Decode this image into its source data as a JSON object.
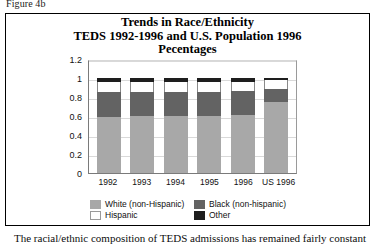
{
  "figure_label": "Figure 4b",
  "caption": "The racial/ethnic composition of TEDS admissions has remained fairly constant",
  "chart_data": {
    "type": "bar",
    "subtype": "stacked-bar",
    "title": "Trends in Race/Ethnicity",
    "title_line2": "TEDS 1992-1996 and U.S. Population 1996",
    "title_line3": "Pecentages",
    "xlabel": "",
    "ylabel": "",
    "ylim": [
      0,
      1.2
    ],
    "ytick_labels": [
      "1.2",
      "1",
      "0.8",
      "0.6",
      "0.4",
      "0.2",
      "0"
    ],
    "ytick_values": [
      1.2,
      1.0,
      0.8,
      0.6,
      0.4,
      0.2,
      0
    ],
    "grid": true,
    "legend_position": "bottom",
    "categories": [
      "1992",
      "1993",
      "1994",
      "1995",
      "1996",
      "US 1996"
    ],
    "series": [
      {
        "name": "White (non-Hispanic)",
        "color": "#a8a8a8",
        "values": [
          0.59,
          0.6,
          0.6,
          0.6,
          0.61,
          0.75
        ]
      },
      {
        "name": "Black (non-hispanic)",
        "color": "#636363",
        "values": [
          0.26,
          0.25,
          0.25,
          0.25,
          0.25,
          0.13
        ]
      },
      {
        "name": "Hispanic",
        "color": "#ffffff",
        "values": [
          0.11,
          0.11,
          0.11,
          0.11,
          0.1,
          0.1
        ]
      },
      {
        "name": "Other",
        "color": "#1e1e1e",
        "values": [
          0.04,
          0.04,
          0.04,
          0.04,
          0.04,
          0.02
        ]
      }
    ]
  }
}
